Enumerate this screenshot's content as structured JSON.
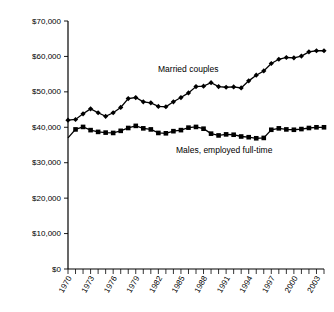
{
  "chart_data": {
    "type": "line",
    "title": "",
    "xlabel": "",
    "ylabel": "",
    "ylim": [
      0,
      70000
    ],
    "xlim": [
      1970,
      2004
    ],
    "grid": false,
    "legend_position": "inline-annotation",
    "y_ticks": [
      0,
      10000,
      20000,
      30000,
      40000,
      50000,
      60000,
      70000
    ],
    "y_tick_labels": [
      "$0",
      "$10,000",
      "$20,000",
      "$30,000",
      "$40,000",
      "$50,000",
      "$60,000",
      "$70,000"
    ],
    "x_ticks": [
      1970,
      1971,
      1972,
      1973,
      1974,
      1975,
      1976,
      1977,
      1978,
      1979,
      1980,
      1981,
      1982,
      1983,
      1984,
      1985,
      1986,
      1987,
      1988,
      1989,
      1990,
      1991,
      1992,
      1993,
      1994,
      1995,
      1996,
      1997,
      1998,
      1999,
      2000,
      2001,
      2002,
      2003,
      2004
    ],
    "x_tick_labels": [
      "1970",
      "1973",
      "1976",
      "1979",
      "1982",
      "1985",
      "1988",
      "1991",
      "1994",
      "1997",
      "2000",
      "2003"
    ],
    "x_labeled_years": [
      1970,
      1973,
      1976,
      1979,
      1982,
      1985,
      1988,
      1991,
      1994,
      1997,
      2000,
      2003
    ],
    "x": [
      1970,
      1971,
      1972,
      1973,
      1974,
      1975,
      1976,
      1977,
      1978,
      1979,
      1980,
      1981,
      1982,
      1983,
      1984,
      1985,
      1986,
      1987,
      1988,
      1989,
      1990,
      1991,
      1992,
      1993,
      1994,
      1995,
      1996,
      1997,
      1998,
      1999,
      2000,
      2001,
      2002,
      2003,
      2004
    ],
    "series": [
      {
        "name": "Married couples",
        "marker": "diamond",
        "color": "#000000",
        "label_text": "Married couples",
        "values": [
          42000,
          42200,
          43800,
          45200,
          44100,
          43100,
          44100,
          45600,
          48100,
          48400,
          47200,
          46900,
          45900,
          45800,
          47200,
          48400,
          49700,
          51500,
          51600,
          52600,
          51500,
          51300,
          51400,
          51100,
          53100,
          54700,
          55900,
          58000,
          59200,
          59700,
          59600,
          60100,
          61300,
          61600,
          61600
        ]
      },
      {
        "name": "Males, employed full-time",
        "marker": "square",
        "color": "#000000",
        "label_text": "Males, employed full-time",
        "values": [
          37000,
          39400,
          40100,
          39200,
          38700,
          38500,
          38400,
          39000,
          39800,
          40400,
          39700,
          39400,
          38400,
          38300,
          38900,
          39200,
          39900,
          40100,
          39600,
          38200,
          37700,
          38000,
          37900,
          37400,
          37200,
          36900,
          37000,
          39300,
          39700,
          39400,
          39300,
          39500,
          39800,
          40000,
          40000
        ]
      }
    ],
    "annotations": [
      {
        "text": "Married couples",
        "x_px": 158,
        "y_px": 72
      },
      {
        "text": "Males, employed full-time",
        "x_px": 176,
        "y_px": 153
      }
    ]
  }
}
